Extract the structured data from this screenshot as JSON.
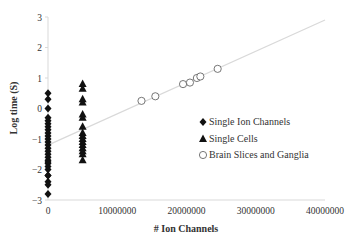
{
  "chart_data": {
    "type": "scatter",
    "title": "",
    "xlabel": "# Ion Channels",
    "ylabel": "Log time (S)",
    "xlim": [
      0,
      40000000
    ],
    "ylim": [
      -3,
      3
    ],
    "x_ticks": [
      "0",
      "10000000",
      "20000000",
      "30000000",
      "40000000"
    ],
    "y_ticks": [
      "-3",
      "-2",
      "-1",
      "0",
      "1",
      "2",
      "3"
    ],
    "grid": false,
    "legend_position": "right-middle",
    "series": [
      {
        "name": "Single Ion Channels",
        "marker": "diamond",
        "x": [
          100,
          100,
          100,
          100,
          100,
          100,
          100,
          100,
          100,
          100,
          100,
          100,
          100,
          100,
          100,
          100,
          100,
          100,
          100,
          100,
          100,
          100,
          100,
          100,
          100,
          100,
          100
        ],
        "y": [
          0.5,
          0.3,
          0,
          -0.3,
          -0.4,
          -0.5,
          -0.6,
          -0.7,
          -0.8,
          -0.9,
          -1.0,
          -1.1,
          -1.2,
          -1.3,
          -1.4,
          -1.5,
          -1.6,
          -1.7,
          -1.8,
          -1.9,
          -2.0,
          -2.2,
          -2.4,
          -2.5,
          -2.8,
          -2.2,
          -1.75
        ]
      },
      {
        "name": "Single Cells",
        "marker": "triangle",
        "x": [
          5000000,
          5000000,
          5000000,
          5000000,
          5000000,
          5000000,
          5000000,
          5000000,
          5000000,
          5000000,
          5000000,
          5000000,
          5000000,
          5000000,
          5000000,
          5000000
        ],
        "y": [
          0.8,
          0.65,
          0.3,
          0.2,
          -0.2,
          -0.3,
          -0.6,
          -0.8,
          -0.9,
          -1.0,
          -1.1,
          -1.2,
          -1.3,
          -1.4,
          -1.5,
          -1.7
        ]
      },
      {
        "name": "Brain Slices and Ganglia",
        "marker": "circle-open",
        "x": [
          13500000,
          15500000,
          19500000,
          20500000,
          21500000,
          22000000,
          24500000
        ],
        "y": [
          0.25,
          0.4,
          0.8,
          0.85,
          1.0,
          1.05,
          1.3
        ]
      }
    ],
    "trendline": {
      "x": [
        0,
        40000000
      ],
      "y": [
        -1.2,
        2.9
      ],
      "color": "#d9d9d9"
    }
  }
}
